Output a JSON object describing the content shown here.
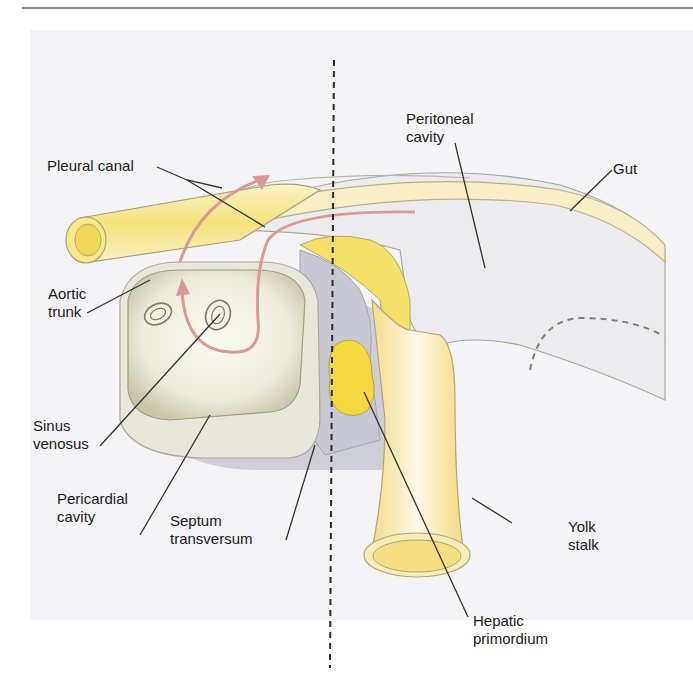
{
  "figure": {
    "type": "anatomical-diagram"
  },
  "labels": {
    "pleural_canal": "Pleural canal",
    "peritoneal_cavity_1": "Peritoneal",
    "peritoneal_cavity_2": "cavity",
    "gut": "Gut",
    "aortic_trunk_1": "Aortic",
    "aortic_trunk_2": "trunk",
    "sinus_venosus_1": "Sinus",
    "sinus_venosus_2": "venosus",
    "pericardial_cavity_1": "Pericardial",
    "pericardial_cavity_2": "cavity",
    "septum_transversum_1": "Septum",
    "septum_transversum_2": "transversum",
    "yolk_stalk_1": "Yolk",
    "yolk_stalk_2": "stalk",
    "hepatic_primordium_1": "Hepatic",
    "hepatic_primordium_2": "primordium"
  },
  "colors": {
    "background": "#f4f4f6",
    "gut_yellow": "#f7e79a",
    "liver_yellow": "#f5dc3c",
    "septum_gray": "#c9c9d3",
    "body_light": "#ececef",
    "arrow_pink": "#d89a94",
    "outline": "#9a9a80",
    "leader": "#333333"
  }
}
